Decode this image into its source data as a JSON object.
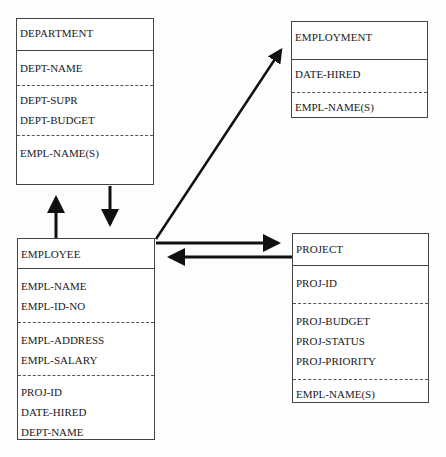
{
  "diagram": {
    "type": "entity-relationship",
    "entities": [
      {
        "id": "department",
        "name": "DEPARTMENT",
        "sections": [
          [
            "DEPT-NAME"
          ],
          [
            "DEPT-SUPR",
            "DEPT-BUDGET"
          ],
          [
            "EMPL-NAME(S)"
          ]
        ]
      },
      {
        "id": "employment",
        "name": "EMPLOYMENT",
        "sections": [
          [
            "DATE-HIRED"
          ],
          [
            "EMPL-NAME(S)"
          ]
        ]
      },
      {
        "id": "employee",
        "name": "EMPLOYEE",
        "sections": [
          [
            "EMPL-NAME",
            "EMPL-ID-NO"
          ],
          [
            "EMPL-ADDRESS",
            "EMPL-SALARY"
          ],
          [
            "PROJ-ID",
            "DATE-HIRED",
            "DEPT-NAME"
          ]
        ]
      },
      {
        "id": "project",
        "name": "PROJECT",
        "sections": [
          [
            "PROJ-ID"
          ],
          [
            "PROJ-BUDGET",
            "PROJ-STATUS",
            "PROJ-PRIORITY"
          ],
          [
            "EMPL-NAME(S)"
          ]
        ]
      }
    ],
    "relationships": [
      {
        "from": "employee",
        "to": "department",
        "direction": "up"
      },
      {
        "from": "department",
        "to": "employee",
        "direction": "down"
      },
      {
        "from": "employee",
        "to": "employment",
        "direction": "diagonal"
      },
      {
        "from": "employee",
        "to": "project",
        "direction": "right"
      },
      {
        "from": "project",
        "to": "employee",
        "direction": "left"
      }
    ],
    "colors": {
      "line": "#111111",
      "border": "#444444",
      "background": "#fdfdfd"
    }
  }
}
